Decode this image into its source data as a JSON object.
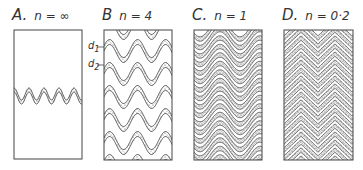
{
  "figure": {
    "panels": [
      {
        "id": "A",
        "letter": "A.",
        "n_label": "n = ∞",
        "n": "∞",
        "layers": 1
      },
      {
        "id": "B",
        "letter": "B",
        "n_label": "n = 4",
        "n": "4",
        "layers": 6
      },
      {
        "id": "C",
        "letter": "C.",
        "n_label": "n = 1",
        "n": "1",
        "layers": 14
      },
      {
        "id": "D",
        "letter": "D.",
        "n_label": "n = 0·2",
        "n": "0.2",
        "layers": 16
      }
    ],
    "annotations": {
      "d1": "d",
      "d1_sub": "1",
      "d2": "d",
      "d2_sub": "2"
    },
    "colors": {
      "line": "#333333",
      "stipple": "#555555",
      "background": "#ffffff"
    }
  }
}
